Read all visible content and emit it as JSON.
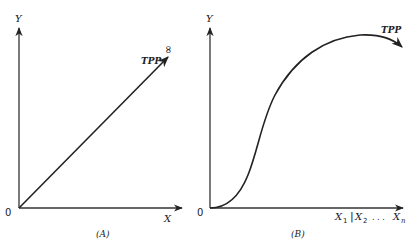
{
  "panels": [
    {
      "id": "A",
      "caption": "(A)",
      "y_axis_label": "Y",
      "x_axis_label": "X",
      "origin_label": "0",
      "curve_label": "TPP",
      "curve_annotation": "∞",
      "curve_shape": "linear"
    },
    {
      "id": "B",
      "caption": "(B)",
      "y_axis_label": "Y",
      "origin_label": "0",
      "curve_label": "TPP",
      "curve_shape": "s-curve-peaking",
      "x_axis_labels": {
        "x1": "X",
        "x1_sub": "1",
        "separator": "|",
        "x2": "X",
        "x2_sub": "2",
        "ellipsis": ". . .",
        "xn": "X",
        "xn_sub": "n"
      }
    }
  ],
  "colors": {
    "ink": "#222222",
    "background": "#ffffff"
  }
}
